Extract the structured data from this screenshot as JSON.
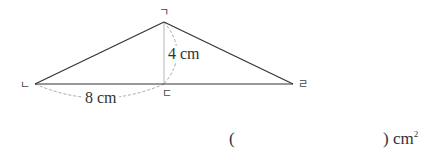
{
  "figure": {
    "type": "triangle",
    "vertices": {
      "top": {
        "label": "ㄱ"
      },
      "left": {
        "label": "ㄴ"
      },
      "foot": {
        "label": "ㄷ"
      },
      "right": {
        "label": "ㄹ"
      }
    },
    "height_label": "4 cm",
    "base_segment_label": "8 cm",
    "colors": {
      "edge": "#333333",
      "altitude": "#b0b0b0",
      "dashed_arc": "#a0a0a0"
    }
  },
  "answer": {
    "open_paren": "(",
    "close_paren": ")",
    "unit": "cm",
    "unit_exponent": "2",
    "value": ""
  }
}
